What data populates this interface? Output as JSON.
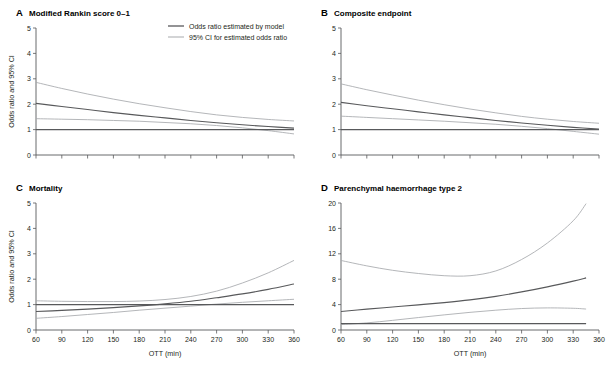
{
  "figure": {
    "legend": {
      "main_label": "Odds ratio estimated by model",
      "ci_label": "95% CI for estimated odds ratio"
    },
    "colors": {
      "main_curve": "#58595b",
      "ci_curve": "#a7a9ac",
      "axis": "#58595b",
      "text": "#231f20"
    },
    "shared": {
      "ylabel": "Odds ratio and 95% CI",
      "xlabel": "OTT (min)"
    }
  },
  "chart_data": [
    {
      "type": "line",
      "panel": "A",
      "letter": "A",
      "title": "Modified Rankin score  0–1",
      "xlabel": "",
      "ylabel": "Odds ratio and 95% CI",
      "xlim": [
        60,
        360
      ],
      "ylim": [
        0,
        5
      ],
      "xticks": [
        60,
        90,
        120,
        150,
        180,
        210,
        240,
        270,
        300,
        330,
        360
      ],
      "xticklabels": [
        "",
        "",
        "",
        "",
        "",
        "",
        "",
        "",
        "",
        "",
        ""
      ],
      "yticks": [
        0,
        1,
        2,
        3,
        4,
        5
      ],
      "yticklabels": [
        "0",
        "1",
        "2",
        "3",
        "4",
        "5"
      ],
      "grid": false,
      "legend_position": "top-right",
      "x": [
        60,
        90,
        120,
        150,
        180,
        210,
        240,
        270,
        300,
        330,
        360
      ],
      "series": [
        {
          "name": "Upper 95% CI",
          "role": "ci",
          "values": [
            2.86,
            2.62,
            2.4,
            2.2,
            2.02,
            1.86,
            1.71,
            1.58,
            1.48,
            1.4,
            1.34
          ]
        },
        {
          "name": "Odds ratio estimated by model",
          "role": "main",
          "values": [
            2.03,
            1.91,
            1.79,
            1.67,
            1.56,
            1.46,
            1.36,
            1.27,
            1.19,
            1.12,
            1.06
          ]
        },
        {
          "name": "Lower 95% CI",
          "role": "ci",
          "values": [
            1.43,
            1.41,
            1.39,
            1.36,
            1.33,
            1.28,
            1.23,
            1.16,
            1.07,
            0.96,
            0.83
          ]
        },
        {
          "name": "Reference (OR=1)",
          "role": "reference",
          "values": [
            1.0,
            1.0,
            1.0,
            1.0,
            1.0,
            1.0,
            1.0,
            1.0,
            1.0,
            1.0,
            1.0
          ]
        }
      ]
    },
    {
      "type": "line",
      "panel": "B",
      "letter": "B",
      "title": "Composite endpoint",
      "xlabel": "",
      "ylabel": "",
      "xlim": [
        60,
        360
      ],
      "ylim": [
        0,
        5
      ],
      "xticks": [
        60,
        90,
        120,
        150,
        180,
        210,
        240,
        270,
        300,
        330,
        360
      ],
      "xticklabels": [
        "",
        "",
        "",
        "",
        "",
        "",
        "",
        "",
        "",
        "",
        ""
      ],
      "yticks": [
        0,
        1,
        2,
        3,
        4,
        5
      ],
      "yticklabels": [
        "0",
        "1",
        "2",
        "3",
        "4",
        "5"
      ],
      "grid": false,
      "legend_position": "none",
      "x": [
        60,
        90,
        120,
        150,
        180,
        210,
        240,
        270,
        300,
        330,
        360
      ],
      "series": [
        {
          "name": "Upper 95% CI",
          "role": "ci",
          "values": [
            2.8,
            2.57,
            2.36,
            2.16,
            1.98,
            1.81,
            1.66,
            1.52,
            1.41,
            1.32,
            1.25
          ]
        },
        {
          "name": "Odds ratio estimated by model",
          "role": "main",
          "values": [
            2.07,
            1.94,
            1.82,
            1.7,
            1.58,
            1.47,
            1.36,
            1.26,
            1.17,
            1.09,
            1.02
          ]
        },
        {
          "name": "Lower 95% CI",
          "role": "ci",
          "values": [
            1.53,
            1.48,
            1.43,
            1.38,
            1.33,
            1.27,
            1.21,
            1.13,
            1.04,
            0.93,
            0.82
          ]
        },
        {
          "name": "Reference (OR=1)",
          "role": "reference",
          "values": [
            1.0,
            1.0,
            1.0,
            1.0,
            1.0,
            1.0,
            1.0,
            1.0,
            1.0,
            1.0,
            1.0
          ]
        }
      ]
    },
    {
      "type": "line",
      "panel": "C",
      "letter": "C",
      "title": "Mortality",
      "xlabel": "OTT (min)",
      "ylabel": "Odds ratio and 95% CI",
      "xlim": [
        60,
        360
      ],
      "ylim": [
        0,
        5
      ],
      "xticks": [
        60,
        90,
        120,
        150,
        180,
        210,
        240,
        270,
        300,
        330,
        360
      ],
      "xticklabels": [
        "60",
        "90",
        "120",
        "150",
        "180",
        "210",
        "240",
        "270",
        "300",
        "330",
        "360"
      ],
      "yticks": [
        0,
        1,
        2,
        3,
        4,
        5
      ],
      "yticklabels": [
        "0",
        "1",
        "2",
        "3",
        "4",
        "5"
      ],
      "grid": false,
      "legend_position": "none",
      "x": [
        60,
        90,
        120,
        150,
        180,
        210,
        240,
        270,
        300,
        330,
        360
      ],
      "series": [
        {
          "name": "Upper 95% CI",
          "role": "ci",
          "values": [
            1.15,
            1.13,
            1.12,
            1.12,
            1.14,
            1.2,
            1.32,
            1.53,
            1.85,
            2.25,
            2.74
          ]
        },
        {
          "name": "Odds ratio estimated by model",
          "role": "main",
          "values": [
            0.73,
            0.77,
            0.82,
            0.88,
            0.95,
            1.03,
            1.13,
            1.27,
            1.42,
            1.6,
            1.81
          ]
        },
        {
          "name": "Lower 95% CI",
          "role": "ci",
          "values": [
            0.46,
            0.53,
            0.61,
            0.69,
            0.78,
            0.86,
            0.94,
            1.02,
            1.09,
            1.15,
            1.21
          ]
        },
        {
          "name": "Reference (OR=1)",
          "role": "reference",
          "values": [
            1.0,
            1.0,
            1.0,
            1.0,
            1.0,
            1.0,
            1.0,
            1.0,
            1.0,
            1.0,
            1.0
          ]
        }
      ]
    },
    {
      "type": "line",
      "panel": "D",
      "letter": "D",
      "title": "Parenchymal haemorrhage type 2",
      "xlabel": "OTT (min)",
      "ylabel": "",
      "xlim": [
        60,
        360
      ],
      "ylim": [
        0,
        20
      ],
      "xticks": [
        60,
        90,
        120,
        150,
        180,
        210,
        240,
        270,
        300,
        330,
        360
      ],
      "xticklabels": [
        "60",
        "90",
        "120",
        "150",
        "180",
        "210",
        "240",
        "270",
        "300",
        "330",
        "360"
      ],
      "yticks": [
        0,
        4,
        8,
        12,
        16,
        20
      ],
      "yticklabels": [
        "0",
        "4",
        "8",
        "12",
        "16",
        "20"
      ],
      "grid": false,
      "legend_position": "none",
      "x": [
        60,
        90,
        120,
        150,
        180,
        210,
        240,
        270,
        300,
        330,
        345
      ],
      "series": [
        {
          "name": "Upper 95% CI",
          "role": "ci",
          "values": [
            10.95,
            10.1,
            9.4,
            8.9,
            8.55,
            8.55,
            9.3,
            11.1,
            13.7,
            17.2,
            19.9
          ]
        },
        {
          "name": "Odds ratio estimated by model",
          "role": "main",
          "values": [
            2.92,
            3.28,
            3.62,
            3.96,
            4.32,
            4.75,
            5.3,
            6.0,
            6.8,
            7.7,
            8.2
          ]
        },
        {
          "name": "Lower 95% CI",
          "role": "ci",
          "values": [
            0.86,
            1.12,
            1.52,
            1.96,
            2.38,
            2.78,
            3.12,
            3.38,
            3.48,
            3.42,
            3.3
          ]
        },
        {
          "name": "Reference (OR=1)",
          "role": "reference",
          "values": [
            1.0,
            1.0,
            1.0,
            1.0,
            1.0,
            1.0,
            1.0,
            1.0,
            1.0,
            1.0,
            1.0
          ]
        }
      ]
    }
  ]
}
